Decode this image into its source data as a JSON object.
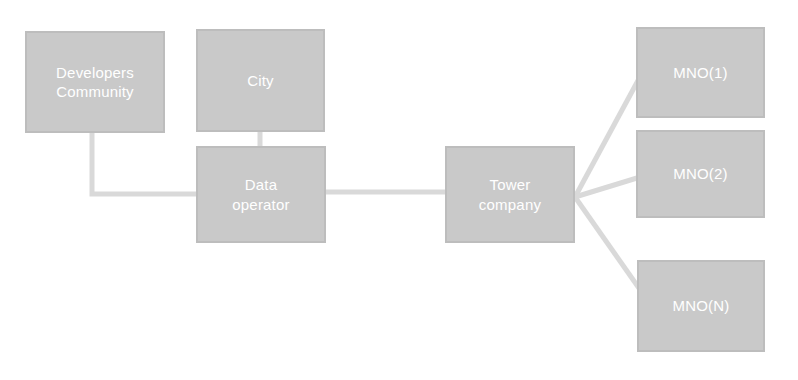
{
  "diagram": {
    "canvas": {
      "width": 798,
      "height": 380,
      "background": "#ffffff"
    },
    "style": {
      "node_fill": "#c9c9c9",
      "node_border": "#bdbdbd",
      "node_text": "#ffffff",
      "edge_color": "#d9d9d9"
    },
    "nodes": [
      {
        "id": "developers-community",
        "label": "Developers\nCommunity",
        "x": 25,
        "y": 31,
        "width": 140,
        "height": 102
      },
      {
        "id": "city",
        "label": "City",
        "x": 196,
        "y": 29,
        "width": 129,
        "height": 103
      },
      {
        "id": "data-operator",
        "label": "Data\noperator",
        "x": 196,
        "y": 146,
        "width": 130,
        "height": 97
      },
      {
        "id": "tower-company",
        "label": "Tower\ncompany",
        "x": 445,
        "y": 146,
        "width": 130,
        "height": 97
      },
      {
        "id": "mno-1",
        "label": "MNO(1)",
        "x": 636,
        "y": 27,
        "width": 129,
        "height": 91
      },
      {
        "id": "mno-2",
        "label": "MNO(2)",
        "x": 636,
        "y": 130,
        "width": 129,
        "height": 88
      },
      {
        "id": "mno-n",
        "label": "MNO(N)",
        "x": 637,
        "y": 260,
        "width": 128,
        "height": 92
      }
    ],
    "edges": [
      {
        "id": "edge-developers-to-data-operator",
        "from": "developers-community",
        "to": "data-operator",
        "shape": "elbow",
        "points": "92,133 92,194 196,194"
      },
      {
        "id": "edge-city-to-data-operator",
        "from": "city",
        "to": "data-operator",
        "shape": "straight",
        "points": "260,132 260,146"
      },
      {
        "id": "edge-data-operator-to-tower-company",
        "from": "data-operator",
        "to": "tower-company",
        "shape": "straight",
        "points": "326,192 445,192"
      },
      {
        "id": "edge-tower-company-to-mno-1",
        "from": "tower-company",
        "to": "mno-1",
        "shape": "straight",
        "points": "575,197 641,75"
      },
      {
        "id": "edge-tower-company-to-mno-2",
        "from": "tower-company",
        "to": "mno-2",
        "shape": "straight",
        "points": "575,197 637,178"
      },
      {
        "id": "edge-tower-company-to-mno-n",
        "from": "tower-company",
        "to": "mno-n",
        "shape": "straight",
        "points": "575,197 648,301"
      }
    ]
  }
}
